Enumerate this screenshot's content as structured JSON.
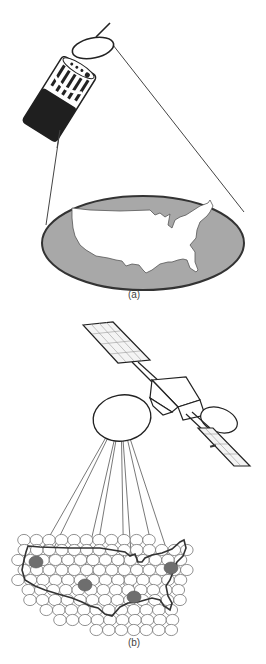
{
  "figure": {
    "panels": [
      {
        "id": "a",
        "label": "(a)",
        "description": "Spin-stabilized satellite illuminating the contiguous United States with a single wide beam",
        "elements": [
          "spinner-satellite",
          "antenna-reflector",
          "beam-cone",
          "coverage-ellipse",
          "usa-map"
        ]
      },
      {
        "id": "b",
        "label": "(b)",
        "description": "Three-axis stabilized satellite with multiple spot beams over a hexagonal grid of cells covering the United States",
        "elements": [
          "three-axis-satellite",
          "solar-panels",
          "antenna-reflector",
          "spot-beams",
          "cell-grid",
          "usa-outline",
          "highlighted-cells"
        ],
        "highlighted_cell_count": 4
      }
    ],
    "colors": {
      "line": "#333333",
      "fill_gray": "#a8a8a8",
      "satellite_dark": "#222222",
      "highlight_cell": "#6e6e6e"
    }
  }
}
